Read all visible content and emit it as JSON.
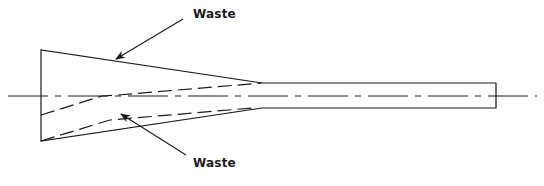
{
  "diagram": {
    "labels": {
      "waste_top": "Waste",
      "waste_bottom": "Waste"
    },
    "colors": {
      "stroke": "#1a1a1a",
      "background": "#ffffff"
    },
    "elements": [
      "tapered workpiece (cone section)",
      "cylindrical section (rectangle)",
      "center line (dash-dot)",
      "hidden/inner cut lines (dashed)",
      "arrow to upper waste region",
      "arrow to lower waste region"
    ]
  }
}
